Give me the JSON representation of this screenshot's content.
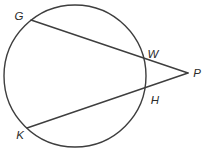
{
  "diagram": {
    "type": "geometry",
    "background": "#ffffff",
    "stroke_color": "#3e3e3e",
    "label_color": "#2a2a2a",
    "stroke_width": "1.4",
    "circle": {
      "cx": "75",
      "cy": "76",
      "r": "71"
    },
    "points": {
      "G": {
        "x": "31",
        "y": "20",
        "on": "circle"
      },
      "W": {
        "x": "144",
        "y": "58",
        "on": "circle"
      },
      "H": {
        "x": "145",
        "y": "88",
        "on": "circle"
      },
      "K": {
        "x": "27",
        "y": "128",
        "on": "circle"
      },
      "P": {
        "x": "188",
        "y": "73",
        "on": "exterior"
      }
    },
    "segments": [
      {
        "from": "G",
        "to": "P"
      },
      {
        "from": "K",
        "to": "P"
      }
    ],
    "labels": {
      "G": {
        "text": "G",
        "x": "19",
        "y": "20"
      },
      "W": {
        "text": "W",
        "x": "153",
        "y": "58"
      },
      "H": {
        "text": "H",
        "x": "155",
        "y": "104"
      },
      "K": {
        "text": "K",
        "x": "20",
        "y": "139"
      },
      "P": {
        "text": "P",
        "x": "197",
        "y": "77"
      }
    }
  }
}
